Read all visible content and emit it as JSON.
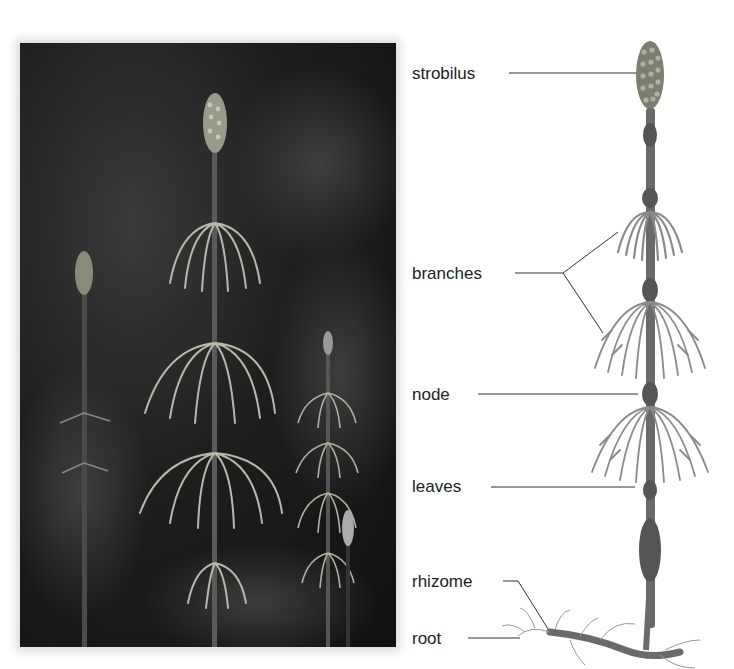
{
  "figure": {
    "photo": {
      "description": "photograph of horsetail plants with whorled branches and cone-like strobili against a dark background"
    },
    "illustration": {
      "description": "labeled drawing of a single horsetail stem"
    }
  },
  "labels": [
    {
      "id": "strobilus",
      "text": "strobilus"
    },
    {
      "id": "branches",
      "text": "branches"
    },
    {
      "id": "node",
      "text": "node"
    },
    {
      "id": "leaves",
      "text": "leaves"
    },
    {
      "id": "rhizome",
      "text": "rhizome"
    },
    {
      "id": "root",
      "text": "root"
    }
  ],
  "colors": {
    "label_text": "#222222",
    "leader_line": "#333333",
    "plant_fill": "#8a8a8a",
    "stem_fill": "#6a6a6a",
    "photo_bg": "#1a1a1a"
  }
}
